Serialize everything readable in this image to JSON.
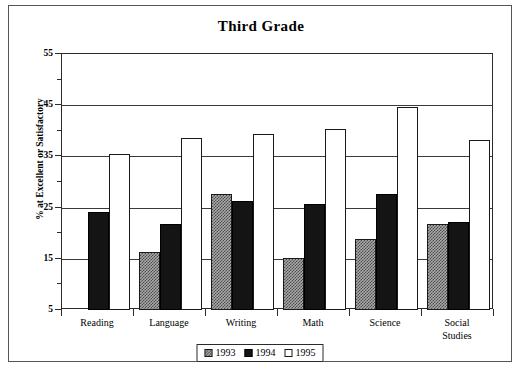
{
  "chart_data": {
    "type": "bar",
    "title": "Third Grade",
    "xlabel": "",
    "ylabel": "% at Excellent or Satisfactory",
    "ylim": [
      5,
      55
    ],
    "ytick_labels": [
      "55",
      "45",
      "35",
      "25",
      "15",
      "5"
    ],
    "ytick_values": [
      55,
      45,
      35,
      25,
      15,
      5
    ],
    "yminor_values": [
      50,
      40,
      30,
      20,
      10
    ],
    "grid": true,
    "legend_position": "bottom-center",
    "categories": [
      "Reading",
      "Language",
      "Writing",
      "Math",
      "Science",
      "Social Studies"
    ],
    "series": [
      {
        "name": "1993",
        "color": "#a9a9a9",
        "pattern": "checker",
        "values": [
          null,
          16.3,
          27.7,
          15.2,
          18.9,
          21.8
        ]
      },
      {
        "name": "1994",
        "color": "#141414",
        "pattern": "solid",
        "values": [
          24.2,
          21.8,
          26.3,
          25.7,
          27.7,
          22.2
        ]
      },
      {
        "name": "1995",
        "color": "#ffffff",
        "pattern": "open",
        "values": [
          35.4,
          38.5,
          39.3,
          40.3,
          44.6,
          38.3
        ]
      }
    ]
  },
  "legend": {
    "entries": [
      {
        "label": "1993"
      },
      {
        "label": "1994"
      },
      {
        "label": "1995"
      }
    ]
  },
  "category_labels": [
    "Reading",
    "Language",
    "Writing",
    "Math",
    "Science",
    "Social\nStudies"
  ]
}
